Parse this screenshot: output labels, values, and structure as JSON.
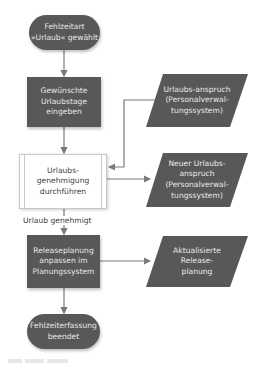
{
  "diagram": {
    "colors": {
      "shape_fill": "#585858",
      "shape_text": "#e8e8e8",
      "connector": "#7a7a7a",
      "subprocess_border": "#c8c8c8"
    },
    "nodes": {
      "start": {
        "type": "terminal",
        "label": "Fehlzeitart »Urlaub« gewählt"
      },
      "enter_days": {
        "type": "process",
        "label": "Gewünschte Urlaubstage eingeben"
      },
      "approve": {
        "type": "predefined-process",
        "label": "Urlaubs-genehmigung durchführen"
      },
      "adjust_release": {
        "type": "process",
        "label": "Releaseplanung anpassen im Planungssystem"
      },
      "end": {
        "type": "terminal",
        "label": "Fehlzeiterfassung beendet"
      },
      "data_entitlement": {
        "type": "data",
        "label": "Urlaubs-anspruch (Personalverwal-tungssystem)"
      },
      "data_new_entitlement": {
        "type": "data",
        "label": "Neuer Urlaubs-anspruch (Personalverwal-tungssystem)"
      },
      "data_updated_release": {
        "type": "data",
        "label": "Aktualisierte Release-planung"
      }
    },
    "edges": [
      {
        "from": "start",
        "to": "enter_days",
        "label": ""
      },
      {
        "from": "enter_days",
        "to": "approve",
        "label": ""
      },
      {
        "from": "data_entitlement",
        "to": "approve",
        "label": ""
      },
      {
        "from": "approve",
        "to": "data_new_entitlement",
        "label": ""
      },
      {
        "from": "approve",
        "to": "adjust_release",
        "label": "Urlaub genehmigt"
      },
      {
        "from": "adjust_release",
        "to": "data_updated_release",
        "label": ""
      },
      {
        "from": "adjust_release",
        "to": "end",
        "label": ""
      }
    ]
  }
}
